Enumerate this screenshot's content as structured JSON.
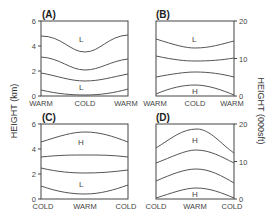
{
  "figure": {
    "left_axis_title": "HEIGHT (km)",
    "right_axis_title": "HEIGHT (000sft)",
    "left_ticks": [
      "0",
      "2",
      "4",
      "6"
    ],
    "right_ticks": [
      "0",
      "10",
      "20"
    ],
    "panels": [
      {
        "id": "A",
        "label": "(A)",
        "x_labels": [
          "WARM",
          "COLD",
          "WARM"
        ],
        "regions": [
          {
            "text": "L",
            "pos": "top"
          },
          {
            "text": "L",
            "pos": "bottom"
          }
        ]
      },
      {
        "id": "B",
        "label": "(B)",
        "x_labels": [
          "WARM",
          "COLD",
          "WARM"
        ],
        "regions": [
          {
            "text": "L",
            "pos": "top"
          },
          {
            "text": "H",
            "pos": "bottom"
          }
        ]
      },
      {
        "id": "C",
        "label": "(C)",
        "x_labels": [
          "COLD",
          "WARM",
          "COLD"
        ],
        "regions": [
          {
            "text": "H",
            "pos": "top"
          },
          {
            "text": "L",
            "pos": "bottom"
          }
        ]
      },
      {
        "id": "D",
        "label": "(D)",
        "x_labels": [
          "COLD",
          "WARM",
          "COLD"
        ],
        "regions": [
          {
            "text": "H",
            "pos": "top"
          },
          {
            "text": "H",
            "pos": "bottom"
          }
        ]
      }
    ]
  }
}
